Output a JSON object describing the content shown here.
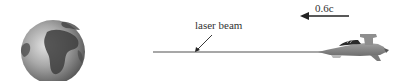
{
  "diagram": {
    "labels": {
      "beam": "laser beam",
      "velocity": "0.6c"
    },
    "elements": {
      "earth": "globe-icon",
      "beam": "laser-beam-line",
      "ship": "spaceship-icon",
      "velocity_arrow": "arrow-left-icon",
      "pointer_arrow": "pointer-arrow-icon"
    },
    "colors": {
      "beam": "#8a8a8a",
      "ship_body": "#8c8c8c",
      "ship_dark": "#2a2a2a",
      "earth_light": "#d0d0d0",
      "earth_dark": "#4a4a4a",
      "arrow": "#222222",
      "text": "#333333"
    }
  }
}
